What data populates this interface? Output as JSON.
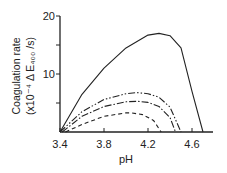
{
  "chart_data": {
    "type": "line",
    "title": "",
    "xlabel": "pH",
    "ylabel": "Coagulation rate (x10^-4 ΔE400/s)",
    "ylabel_line1": "Coagulation rate",
    "ylabel_line2": "(x10⁻⁴ Δ E₄₀₀ /s)",
    "xlim": [
      3.4,
      4.8
    ],
    "ylim": [
      0,
      20
    ],
    "xticks": [
      "3.4",
      "3.8",
      "4.2",
      "4.6"
    ],
    "yticks": [
      "10",
      "20"
    ],
    "grid": false,
    "series": [
      {
        "name": "solid",
        "style": "solid",
        "x": [
          3.4,
          3.6,
          3.8,
          4.0,
          4.2,
          4.3,
          4.4,
          4.5,
          4.6,
          4.7
        ],
        "y": [
          0,
          6.5,
          11,
          14.5,
          16.7,
          17,
          16.6,
          14.5,
          7,
          0
        ]
      },
      {
        "name": "dash-dot-dot",
        "style": "dash-dot-dot",
        "x": [
          3.4,
          3.6,
          3.8,
          4.0,
          4.1,
          4.2,
          4.3,
          4.4,
          4.5
        ],
        "y": [
          0,
          3.5,
          5.6,
          6.6,
          6.8,
          6.6,
          6,
          4.3,
          0
        ]
      },
      {
        "name": "dash-dot",
        "style": "dash-dot",
        "x": [
          3.42,
          3.6,
          3.8,
          4.0,
          4.1,
          4.2,
          4.3,
          4.4,
          4.45
        ],
        "y": [
          0,
          2.7,
          4.4,
          5.2,
          5.3,
          5.1,
          4.4,
          2.5,
          0
        ]
      },
      {
        "name": "dashed",
        "style": "dashed",
        "x": [
          3.45,
          3.6,
          3.8,
          4.0,
          4.05,
          4.15,
          4.25,
          4.32
        ],
        "y": [
          0,
          1.3,
          2.7,
          3.3,
          3.3,
          3,
          2,
          0
        ]
      }
    ]
  }
}
